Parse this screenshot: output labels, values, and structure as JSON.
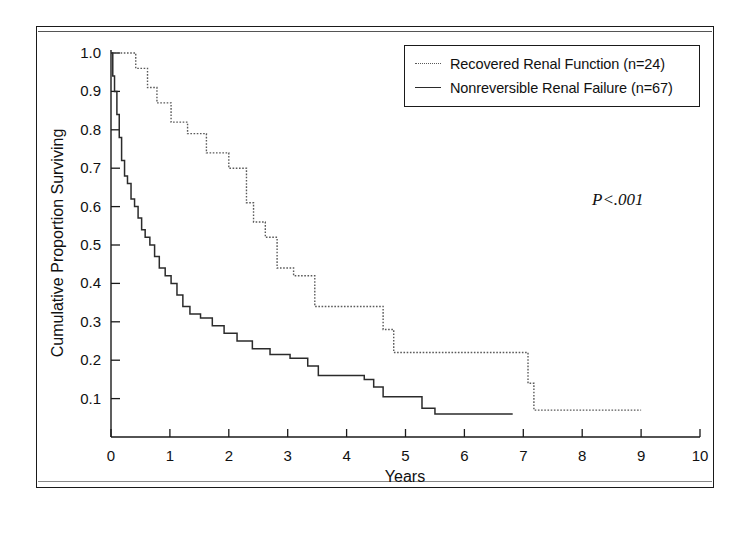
{
  "figure": {
    "pvalue_annotation": "P<.001"
  },
  "axes": {
    "x_title": "Years",
    "y_title": "Cumulative Proportion Surviving",
    "x_ticks": [
      "0",
      "1",
      "2",
      "3",
      "4",
      "5",
      "6",
      "7",
      "8",
      "9",
      "10"
    ],
    "y_ticks": [
      "0.1",
      "0.2",
      "0.3",
      "0.4",
      "0.5",
      "0.6",
      "0.7",
      "0.8",
      "0.9",
      "1.0"
    ]
  },
  "legend": {
    "items": [
      {
        "label": "Recovered Renal Function (n=24)",
        "style": "dotted"
      },
      {
        "label": "Nonreversible Renal Failure (n=67)",
        "style": "solid"
      }
    ]
  },
  "chart_data": {
    "type": "line",
    "subtype": "kaplan-meier-step",
    "title": "",
    "xlabel": "Years",
    "ylabel": "Cumulative Proportion Surviving",
    "xlim": [
      0,
      10
    ],
    "ylim": [
      0,
      1.0
    ],
    "xticks": [
      0,
      1,
      2,
      3,
      4,
      5,
      6,
      7,
      8,
      9,
      10
    ],
    "yticks": [
      0.1,
      0.2,
      0.3,
      0.4,
      0.5,
      0.6,
      0.7,
      0.8,
      0.9,
      1.0
    ],
    "grid": false,
    "legend_position": "top-right",
    "annotations": [
      {
        "text": "P<.001",
        "x": 8.1,
        "y": 0.56,
        "style": "italic"
      }
    ],
    "series": [
      {
        "name": "Recovered Renal Function (n=24)",
        "n": 24,
        "style": "dotted",
        "color": "#5a5a5a",
        "points": [
          [
            0.0,
            1.0
          ],
          [
            0.42,
            1.0
          ],
          [
            0.42,
            0.96
          ],
          [
            0.62,
            0.96
          ],
          [
            0.62,
            0.91
          ],
          [
            0.78,
            0.91
          ],
          [
            0.78,
            0.87
          ],
          [
            1.02,
            0.87
          ],
          [
            1.02,
            0.82
          ],
          [
            1.3,
            0.82
          ],
          [
            1.3,
            0.79
          ],
          [
            1.62,
            0.79
          ],
          [
            1.62,
            0.74
          ],
          [
            2.0,
            0.74
          ],
          [
            2.0,
            0.7
          ],
          [
            2.3,
            0.7
          ],
          [
            2.3,
            0.61
          ],
          [
            2.42,
            0.61
          ],
          [
            2.42,
            0.56
          ],
          [
            2.62,
            0.56
          ],
          [
            2.62,
            0.52
          ],
          [
            2.82,
            0.52
          ],
          [
            2.82,
            0.44
          ],
          [
            3.1,
            0.44
          ],
          [
            3.1,
            0.42
          ],
          [
            3.46,
            0.42
          ],
          [
            3.46,
            0.34
          ],
          [
            4.62,
            0.34
          ],
          [
            4.62,
            0.28
          ],
          [
            4.8,
            0.28
          ],
          [
            4.8,
            0.22
          ],
          [
            7.08,
            0.22
          ],
          [
            7.08,
            0.14
          ],
          [
            7.18,
            0.14
          ],
          [
            7.18,
            0.07
          ],
          [
            9.0,
            0.07
          ]
        ]
      },
      {
        "name": "Nonreversible Renal Failure (n=67)",
        "n": 67,
        "style": "solid",
        "color": "#2b2b2b",
        "points": [
          [
            0.0,
            1.0
          ],
          [
            0.03,
            1.0
          ],
          [
            0.03,
            0.94
          ],
          [
            0.06,
            0.94
          ],
          [
            0.06,
            0.9
          ],
          [
            0.1,
            0.9
          ],
          [
            0.1,
            0.84
          ],
          [
            0.14,
            0.84
          ],
          [
            0.14,
            0.78
          ],
          [
            0.18,
            0.78
          ],
          [
            0.18,
            0.72
          ],
          [
            0.23,
            0.72
          ],
          [
            0.23,
            0.68
          ],
          [
            0.28,
            0.68
          ],
          [
            0.28,
            0.66
          ],
          [
            0.34,
            0.66
          ],
          [
            0.34,
            0.62
          ],
          [
            0.4,
            0.62
          ],
          [
            0.4,
            0.6
          ],
          [
            0.46,
            0.6
          ],
          [
            0.46,
            0.57
          ],
          [
            0.52,
            0.57
          ],
          [
            0.52,
            0.54
          ],
          [
            0.58,
            0.54
          ],
          [
            0.58,
            0.52
          ],
          [
            0.66,
            0.52
          ],
          [
            0.66,
            0.5
          ],
          [
            0.74,
            0.5
          ],
          [
            0.74,
            0.47
          ],
          [
            0.82,
            0.47
          ],
          [
            0.82,
            0.44
          ],
          [
            0.92,
            0.44
          ],
          [
            0.92,
            0.42
          ],
          [
            1.02,
            0.42
          ],
          [
            1.02,
            0.4
          ],
          [
            1.12,
            0.4
          ],
          [
            1.12,
            0.37
          ],
          [
            1.22,
            0.37
          ],
          [
            1.22,
            0.34
          ],
          [
            1.34,
            0.34
          ],
          [
            1.34,
            0.32
          ],
          [
            1.52,
            0.32
          ],
          [
            1.52,
            0.31
          ],
          [
            1.72,
            0.31
          ],
          [
            1.72,
            0.29
          ],
          [
            1.92,
            0.29
          ],
          [
            1.92,
            0.27
          ],
          [
            2.14,
            0.27
          ],
          [
            2.14,
            0.25
          ],
          [
            2.4,
            0.25
          ],
          [
            2.4,
            0.23
          ],
          [
            2.7,
            0.23
          ],
          [
            2.7,
            0.215
          ],
          [
            3.04,
            0.215
          ],
          [
            3.04,
            0.205
          ],
          [
            3.34,
            0.205
          ],
          [
            3.34,
            0.185
          ],
          [
            3.52,
            0.185
          ],
          [
            3.52,
            0.16
          ],
          [
            4.3,
            0.16
          ],
          [
            4.3,
            0.15
          ],
          [
            4.46,
            0.15
          ],
          [
            4.46,
            0.13
          ],
          [
            4.62,
            0.13
          ],
          [
            4.62,
            0.105
          ],
          [
            5.28,
            0.105
          ],
          [
            5.28,
            0.075
          ],
          [
            5.5,
            0.075
          ],
          [
            5.5,
            0.06
          ],
          [
            6.82,
            0.06
          ]
        ]
      }
    ]
  }
}
